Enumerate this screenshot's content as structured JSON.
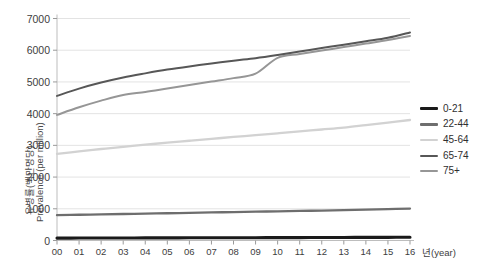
{
  "chart_data": {
    "type": "line",
    "title": "",
    "xlabel": "년(year)",
    "ylabel_ko": "유병률(백만명당)",
    "ylabel_en": "Prevalence (per million)",
    "x": [
      "00",
      "01",
      "02",
      "03",
      "04",
      "05",
      "06",
      "07",
      "08",
      "09",
      "10",
      "11",
      "12",
      "13",
      "14",
      "15",
      "16"
    ],
    "categories": [
      "00",
      "01",
      "02",
      "03",
      "04",
      "05",
      "06",
      "07",
      "08",
      "09",
      "10",
      "11",
      "12",
      "13",
      "14",
      "15",
      "16"
    ],
    "ylim": [
      0,
      7000
    ],
    "yticks": [
      0,
      1000,
      2000,
      3000,
      4000,
      5000,
      6000,
      7000
    ],
    "grid": true,
    "legend_position": "right",
    "series": [
      {
        "name": "0-21",
        "color": "#1a1a1a",
        "width": 3.1,
        "values": [
          75,
          77,
          79,
          80,
          82,
          83,
          85,
          86,
          88,
          89,
          91,
          92,
          94,
          96,
          98,
          100,
          102
        ]
      },
      {
        "name": "22-44",
        "color": "#6e6e6e",
        "width": 2.3,
        "values": [
          800,
          812,
          824,
          836,
          848,
          860,
          872,
          884,
          896,
          908,
          920,
          932,
          944,
          958,
          972,
          988,
          1005
        ]
      },
      {
        "name": "45-64",
        "color": "#d2d2d2",
        "width": 2.3,
        "values": [
          2730,
          2810,
          2885,
          2955,
          3020,
          3085,
          3145,
          3205,
          3265,
          3320,
          3380,
          3440,
          3500,
          3560,
          3640,
          3720,
          3800
        ]
      },
      {
        "name": "65-74",
        "color": "#575757",
        "width": 2.0,
        "values": [
          4560,
          4790,
          4980,
          5140,
          5270,
          5390,
          5490,
          5580,
          5670,
          5750,
          5850,
          5960,
          6070,
          6175,
          6280,
          6390,
          6560
        ]
      },
      {
        "name": "75+",
        "color": "#969696",
        "width": 2.0,
        "values": [
          3960,
          4200,
          4410,
          4590,
          4680,
          4790,
          4900,
          5010,
          5120,
          5260,
          5760,
          5880,
          5990,
          6100,
          6210,
          6320,
          6450
        ]
      }
    ]
  },
  "legend": {
    "items": [
      {
        "label": "0-21"
      },
      {
        "label": "22-44"
      },
      {
        "label": "45-64"
      },
      {
        "label": "65-74"
      },
      {
        "label": "75+"
      }
    ]
  }
}
